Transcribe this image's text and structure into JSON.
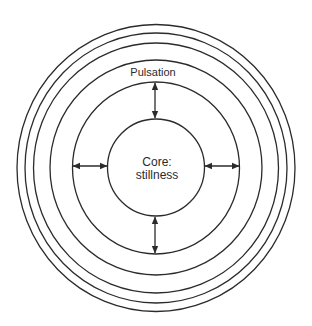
{
  "diagram": {
    "type": "concentric-circles",
    "center": {
      "x": 156,
      "y": 168
    },
    "colors": {
      "stroke": "#2b2b2b",
      "background": "#ffffff"
    },
    "rings": [
      {
        "name": "outer-ring-6",
        "rx": 139,
        "ry": 143.5
      },
      {
        "name": "outer-ring-5",
        "rx": 131,
        "ry": 135
      },
      {
        "name": "outer-ring-4",
        "rx": 122.5,
        "ry": 125
      },
      {
        "name": "ring-3",
        "rx": 106,
        "ry": 107.5
      },
      {
        "name": "pulsation-ring",
        "rx": 83.5,
        "ry": 86
      },
      {
        "name": "core-circle",
        "rx": 48.5,
        "ry": 48.5
      }
    ],
    "labels": {
      "pulsation": "Pulsation",
      "core_line1": "Core:",
      "core_line2": "stillness"
    },
    "arrows": [
      {
        "name": "arrow-top",
        "direction": "vertical",
        "from": "pulsation-ring",
        "to": "core-circle"
      },
      {
        "name": "arrow-bottom",
        "direction": "vertical",
        "from": "core-circle",
        "to": "pulsation-ring"
      },
      {
        "name": "arrow-left",
        "direction": "horizontal",
        "from": "pulsation-ring",
        "to": "core-circle"
      },
      {
        "name": "arrow-right",
        "direction": "horizontal",
        "from": "core-circle",
        "to": "pulsation-ring"
      }
    ]
  }
}
